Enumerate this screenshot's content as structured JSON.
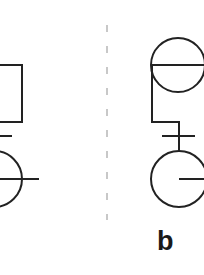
{
  "diagram": {
    "type": "pedigree-symbols",
    "stroke_color": "#222222",
    "divider_color": "#c8c8c8",
    "panels": [
      {
        "id": "a",
        "visible_label": null,
        "elements": [
          {
            "kind": "square",
            "description": "square symbol, partially cropped at left edge"
          },
          {
            "kind": "crossbar",
            "description": "short horizontal tick on connecting line"
          },
          {
            "kind": "circle",
            "description": "circle symbol with horizontal line through center extending right"
          }
        ]
      },
      {
        "id": "b",
        "label": "b",
        "elements": [
          {
            "kind": "circle",
            "description": "circle symbol with horizontal diameter line"
          },
          {
            "kind": "connector",
            "description": "line from left of top circle down and right to lower circle"
          },
          {
            "kind": "crossbar",
            "description": "short horizontal tick crossing vertical connector"
          },
          {
            "kind": "circle",
            "description": "circle with radius line from center to right"
          }
        ]
      }
    ],
    "divider": {
      "style": "dashed",
      "orientation": "vertical"
    }
  }
}
